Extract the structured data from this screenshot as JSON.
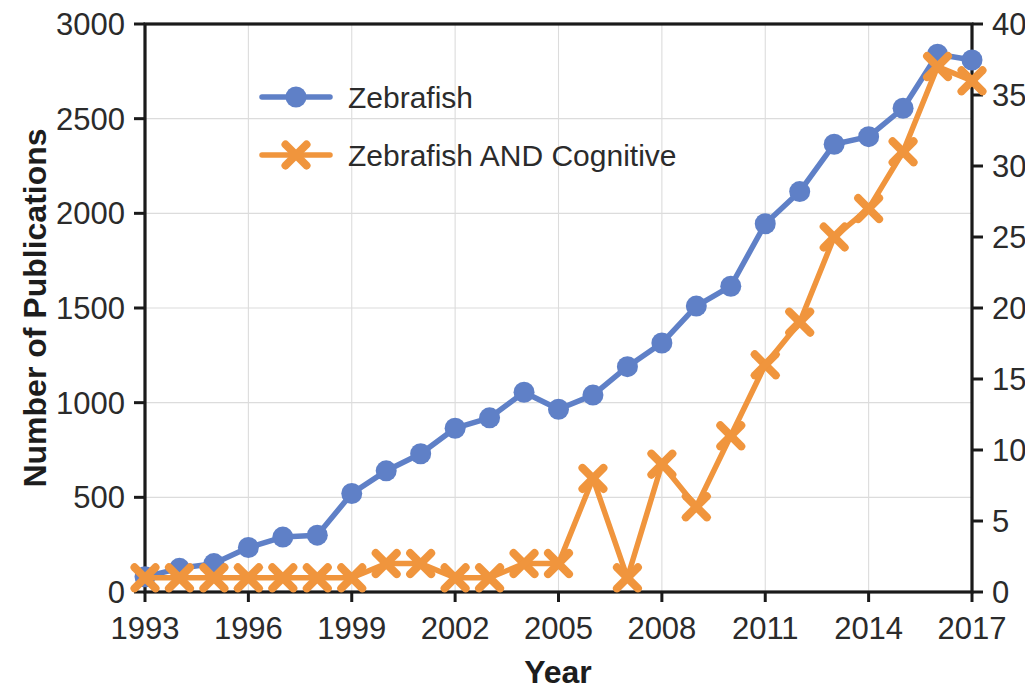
{
  "chart_data": {
    "type": "line",
    "title": "",
    "xlabel": "Year",
    "ylabel": "Number of Publications",
    "y2label": "",
    "grid": true,
    "legend_position": "top-left-inside",
    "x": [
      1993,
      1994,
      1995,
      1996,
      1997,
      1998,
      1999,
      2000,
      2001,
      2002,
      2003,
      2004,
      2005,
      2006,
      2007,
      2008,
      2009,
      2010,
      2011,
      2012,
      2013,
      2014,
      2015,
      2016,
      2017
    ],
    "xlim": [
      1993,
      2017
    ],
    "xticks": [
      1993,
      1996,
      1999,
      2002,
      2005,
      2008,
      2011,
      2014,
      2017
    ],
    "xtick_labels": [
      "1993",
      "1996",
      "1999",
      "2002",
      "2005",
      "2008",
      "2011",
      "2014",
      "2017"
    ],
    "ylim": [
      0,
      3000
    ],
    "yticks": [
      0,
      500,
      1000,
      1500,
      2000,
      2500,
      3000
    ],
    "ytick_labels": [
      "0",
      "500",
      "1000",
      "1500",
      "2000",
      "2500",
      "3000"
    ],
    "y2lim": [
      0,
      40
    ],
    "y2ticks": [
      0,
      5,
      10,
      15,
      20,
      25,
      30,
      35,
      40
    ],
    "y2tick_labels": [
      "0",
      "5",
      "10",
      "15",
      "20",
      "25",
      "30",
      "35",
      "40"
    ],
    "series": [
      {
        "name": "Zebrafish",
        "axis": "left",
        "color": "#5F80C7",
        "marker": "circle",
        "values": [
          80,
          125,
          150,
          235,
          290,
          300,
          520,
          640,
          730,
          865,
          920,
          1055,
          965,
          1040,
          1190,
          1315,
          1510,
          1615,
          1945,
          2115,
          2365,
          2405,
          2555,
          2840,
          2810
        ]
      },
      {
        "name": "Zebrafish AND Cognitive",
        "axis": "right",
        "color": "#F0953D",
        "marker": "x",
        "values": [
          1,
          1,
          1,
          1,
          1,
          1,
          1,
          2,
          2,
          1,
          1,
          2,
          2,
          8,
          1,
          9,
          6,
          11,
          16,
          19,
          25,
          27,
          31,
          37,
          36
        ]
      }
    ]
  },
  "legend": {
    "items": [
      {
        "label": "Zebrafish",
        "color": "#5F80C7",
        "marker": "circle"
      },
      {
        "label": "Zebrafish AND Cognitive",
        "color": "#F0953D",
        "marker": "x"
      }
    ]
  },
  "colors": {
    "series_blue": "#5F80C7",
    "series_orange": "#F0953D",
    "axis": "#1a1a1a",
    "grid": "#dcdcdc",
    "background": "#ffffff"
  }
}
